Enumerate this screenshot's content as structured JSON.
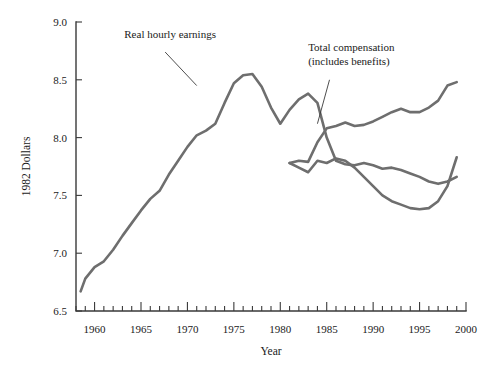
{
  "chart_data": {
    "type": "line",
    "title": "",
    "xlabel": "Year",
    "ylabel": "1982 Dollars",
    "xlim": [
      1958,
      2000
    ],
    "ylim": [
      6.5,
      9.0
    ],
    "grid": false,
    "legend_position": "inline-annotations",
    "x_ticks_major": [
      1960,
      1965,
      1970,
      1975,
      1980,
      1985,
      1990,
      1995,
      2000
    ],
    "x_tick_labels": [
      "1960",
      "1965",
      "1970",
      "1975",
      "1980",
      "1985",
      "1990",
      "1995",
      "2000"
    ],
    "x_minor_tick_step": 1,
    "y_ticks": [
      6.5,
      7.0,
      7.5,
      8.0,
      8.5,
      9.0
    ],
    "y_tick_labels": [
      "6.5",
      "7.0",
      "7.5",
      "8.0",
      "8.5",
      "9.0"
    ],
    "line_color": "#6e6e6e",
    "annotations": [
      {
        "name": "real-hourly-earnings",
        "lines": [
          "Real hourly earnings"
        ],
        "text_x": 1963.2,
        "text_y": 8.86,
        "leader_from": [
          1967.6,
          8.74
        ],
        "leader_to": [
          1971.0,
          8.45
        ]
      },
      {
        "name": "total-compensation",
        "lines": [
          "Total compensation",
          "(includes benefits)"
        ],
        "text_x": 1983.0,
        "text_y": 8.75,
        "leader_from": [
          1985.3,
          8.5
        ],
        "leader_to": [
          1984.0,
          8.12
        ]
      }
    ],
    "series": [
      {
        "name": "Real hourly earnings",
        "x": [
          1958.5,
          1959,
          1960,
          1961,
          1962,
          1963,
          1964,
          1965,
          1966,
          1967,
          1968,
          1969,
          1970,
          1971,
          1972,
          1973,
          1974,
          1975,
          1976,
          1977,
          1978,
          1979,
          1980,
          1981,
          1982,
          1983,
          1984,
          1985,
          1986,
          1987,
          1988,
          1989,
          1990,
          1991,
          1992,
          1993,
          1994,
          1995,
          1996,
          1997,
          1998,
          1999
        ],
        "values": [
          6.67,
          6.78,
          6.88,
          6.93,
          7.03,
          7.15,
          7.26,
          7.37,
          7.47,
          7.54,
          7.68,
          7.8,
          7.92,
          8.02,
          8.06,
          8.12,
          8.3,
          8.47,
          8.54,
          8.55,
          8.44,
          8.26,
          8.12,
          8.24,
          8.33,
          8.38,
          8.3,
          8.0,
          7.8,
          7.77,
          7.76,
          7.78,
          7.76,
          7.73,
          7.74,
          7.72,
          7.69,
          7.66,
          7.62,
          7.6,
          7.62,
          7.66
        ]
      },
      {
        "name": "Real hourly earnings (post-1981 branch)",
        "x": [
          1981,
          1982,
          1983,
          1984,
          1985,
          1986,
          1987,
          1988,
          1989,
          1990,
          1991,
          1992,
          1993,
          1994,
          1995,
          1996,
          1997,
          1998,
          1999
        ],
        "values": [
          7.78,
          7.74,
          7.7,
          7.8,
          7.78,
          7.82,
          7.8,
          7.74,
          7.66,
          7.58,
          7.5,
          7.45,
          7.42,
          7.39,
          7.38,
          7.39,
          7.45,
          7.58,
          7.83
        ]
      },
      {
        "name": "Total compensation (includes benefits)",
        "x": [
          1981,
          1982,
          1983,
          1984,
          1985,
          1986,
          1987,
          1988,
          1989,
          1990,
          1991,
          1992,
          1993,
          1994,
          1995,
          1996,
          1997,
          1998,
          1999
        ],
        "values": [
          7.78,
          7.8,
          7.79,
          7.96,
          8.08,
          8.1,
          8.13,
          8.1,
          8.11,
          8.14,
          8.18,
          8.22,
          8.25,
          8.22,
          8.22,
          8.26,
          8.32,
          8.45,
          8.48
        ]
      }
    ]
  },
  "axis": {
    "y_title": "1982 Dollars",
    "x_title": "Year"
  }
}
